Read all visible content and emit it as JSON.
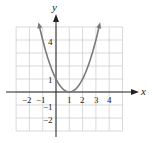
{
  "chart_data": {
    "type": "line",
    "title": "",
    "function": "y = (x - 1)^2",
    "xlabel": "x",
    "ylabel": "y",
    "xlim": [
      -3,
      5
    ],
    "ylim": [
      -3,
      5
    ],
    "grid": true,
    "x_tick_labels": [
      "−2",
      "−1",
      "1",
      "2",
      "3",
      "4"
    ],
    "y_tick_labels": [
      "4",
      "1",
      "−1",
      "−2"
    ],
    "series": [
      {
        "name": "parabola",
        "x": [
          -1.2,
          -1,
          0,
          1,
          2,
          3,
          3.2
        ],
        "y": [
          4.84,
          4,
          1,
          0,
          1,
          4,
          4.84
        ],
        "color": "#7a7a7a"
      }
    ],
    "vertex": [
      1,
      0
    ]
  },
  "colors": {
    "grid": "#cfcfcf",
    "axis": "#222222",
    "curve": "#7a7a7a"
  }
}
